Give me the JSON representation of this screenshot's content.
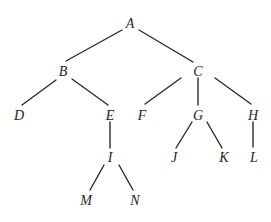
{
  "diagram": {
    "type": "tree",
    "width": 271,
    "height": 222,
    "line_color": "#2a2a2a",
    "text_color": "#1e1e1e",
    "nodes": [
      {
        "id": "A",
        "label": "A",
        "x": 130,
        "y": 23
      },
      {
        "id": "B",
        "label": "B",
        "x": 63,
        "y": 71
      },
      {
        "id": "C",
        "label": "C",
        "x": 198,
        "y": 71
      },
      {
        "id": "D",
        "label": "D",
        "x": 19,
        "y": 115
      },
      {
        "id": "E",
        "label": "E",
        "x": 110,
        "y": 115
      },
      {
        "id": "F",
        "label": "F",
        "x": 142,
        "y": 115
      },
      {
        "id": "G",
        "label": "G",
        "x": 198,
        "y": 115
      },
      {
        "id": "H",
        "label": "H",
        "x": 253,
        "y": 115
      },
      {
        "id": "I",
        "label": "I",
        "x": 110,
        "y": 157
      },
      {
        "id": "J",
        "label": "J",
        "x": 174,
        "y": 157
      },
      {
        "id": "K",
        "label": "K",
        "x": 224,
        "y": 157
      },
      {
        "id": "L",
        "label": "L",
        "x": 254,
        "y": 157
      },
      {
        "id": "M",
        "label": "M",
        "x": 86,
        "y": 200
      },
      {
        "id": "N",
        "label": "N",
        "x": 135,
        "y": 200
      }
    ],
    "edges": [
      {
        "from": "A",
        "to": "B",
        "x1": 122,
        "y1": 30,
        "x2": 66,
        "y2": 61
      },
      {
        "from": "A",
        "to": "C",
        "x1": 139,
        "y1": 30,
        "x2": 193,
        "y2": 62
      },
      {
        "from": "B",
        "to": "D",
        "x1": 56,
        "y1": 80,
        "x2": 22,
        "y2": 105
      },
      {
        "from": "B",
        "to": "E",
        "x1": 72,
        "y1": 79,
        "x2": 108,
        "y2": 105
      },
      {
        "from": "C",
        "to": "F",
        "x1": 181,
        "y1": 78,
        "x2": 145,
        "y2": 104
      },
      {
        "from": "C",
        "to": "G",
        "x1": 198,
        "y1": 78,
        "x2": 198,
        "y2": 105
      },
      {
        "from": "C",
        "to": "H",
        "x1": 215,
        "y1": 78,
        "x2": 251,
        "y2": 104
      },
      {
        "from": "E",
        "to": "I",
        "x1": 110,
        "y1": 122,
        "x2": 110,
        "y2": 148
      },
      {
        "from": "G",
        "to": "J",
        "x1": 192,
        "y1": 122,
        "x2": 176,
        "y2": 148
      },
      {
        "from": "G",
        "to": "K",
        "x1": 207,
        "y1": 122,
        "x2": 222,
        "y2": 148
      },
      {
        "from": "H",
        "to": "L",
        "x1": 253,
        "y1": 122,
        "x2": 253,
        "y2": 147
      },
      {
        "from": "I",
        "to": "M",
        "x1": 104,
        "y1": 165,
        "x2": 90,
        "y2": 190
      },
      {
        "from": "I",
        "to": "N",
        "x1": 119,
        "y1": 165,
        "x2": 133,
        "y2": 190
      }
    ]
  }
}
